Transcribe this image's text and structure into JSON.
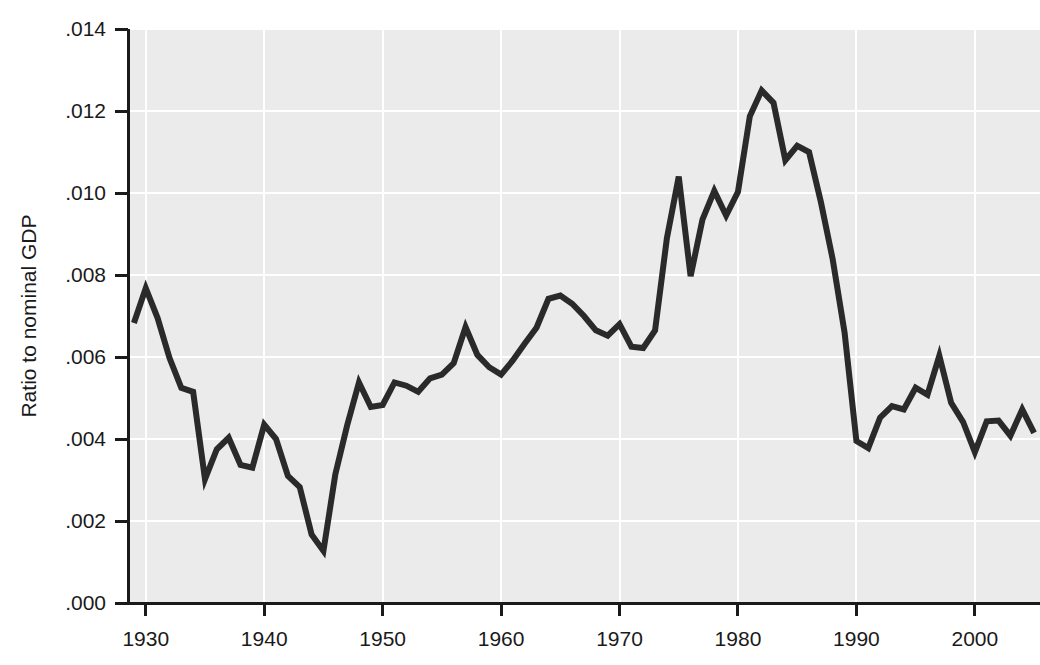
{
  "chart_data": {
    "type": "line",
    "title": "",
    "subtitle": "",
    "xlabel": "",
    "ylabel": "Ratio to nominal GDP",
    "xlim": [
      1928.5,
      2005.5
    ],
    "ylim": [
      0.0,
      0.014
    ],
    "xticks": [
      1930,
      1940,
      1950,
      1960,
      1970,
      1980,
      1990,
      2000
    ],
    "xticklabels": [
      "1930",
      "1940",
      "1950",
      "1960",
      "1970",
      "1980",
      "1990",
      "2000"
    ],
    "yticks": [
      0.0,
      0.002,
      0.004,
      0.006,
      0.008,
      0.01,
      0.012,
      0.014
    ],
    "yticklabels": [
      ".000",
      ".002",
      ".004",
      ".006",
      ".008",
      ".010",
      ".012",
      ".014"
    ],
    "grid": true,
    "grid_color": "#ffffff",
    "plot_background": "#ebebeb",
    "page_background": "#ffffff",
    "line_color": "#2a2a2a",
    "legend": null,
    "legend_position": "none",
    "series": [
      {
        "name": "Ratio to nominal GDP",
        "x": [
          1929,
          1930,
          1931,
          1932,
          1933,
          1934,
          1935,
          1936,
          1937,
          1938,
          1939,
          1940,
          1941,
          1942,
          1943,
          1944,
          1945,
          1946,
          1947,
          1948,
          1949,
          1950,
          1951,
          1952,
          1953,
          1954,
          1955,
          1956,
          1957,
          1958,
          1959,
          1960,
          1961,
          1962,
          1963,
          1964,
          1965,
          1966,
          1967,
          1968,
          1969,
          1970,
          1971,
          1972,
          1973,
          1974,
          1975,
          1976,
          1977,
          1978,
          1979,
          1980,
          1981,
          1982,
          1983,
          1984,
          1985,
          1986,
          1987,
          1988,
          1989,
          1990,
          1991,
          1992,
          1993,
          1994,
          1995,
          1996,
          1997,
          1998,
          1999,
          2000,
          2001,
          2002,
          2003,
          2004,
          2005
        ],
        "values": [
          0.00683,
          0.00768,
          0.00695,
          0.00598,
          0.00525,
          0.00515,
          0.00302,
          0.00375,
          0.00403,
          0.00337,
          0.0033,
          0.00435,
          0.004,
          0.0031,
          0.00283,
          0.00167,
          0.00127,
          0.00313,
          0.00433,
          0.00538,
          0.00478,
          0.00483,
          0.00538,
          0.0053,
          0.00515,
          0.00548,
          0.00557,
          0.00585,
          0.00673,
          0.00605,
          0.00575,
          0.00557,
          0.00592,
          0.00633,
          0.00672,
          0.00742,
          0.0075,
          0.0073,
          0.007,
          0.00665,
          0.00652,
          0.0068,
          0.00625,
          0.00622,
          0.00665,
          0.0089,
          0.0104,
          0.00797,
          0.00935,
          0.01005,
          0.00945,
          0.01003,
          0.01187,
          0.0125,
          0.0122,
          0.0108,
          0.01115,
          0.011,
          0.00978,
          0.00838,
          0.0066,
          0.00395,
          0.00378,
          0.00452,
          0.0048,
          0.00472,
          0.00525,
          0.00508,
          0.00603,
          0.00488,
          0.00442,
          0.00368,
          0.00443,
          0.00445,
          0.00408,
          0.00472,
          0.00415
        ],
        "style": "solid",
        "width": 6
      }
    ],
    "notes": [
      "Peak value 0.0125 occurs around 1982.",
      "Minimum value 0.0013 occurs around 1945.",
      "Secondary low of 0.0030 occurs around 1935."
    ]
  },
  "geometry": {
    "plot_left": 128,
    "plot_right": 1040,
    "plot_top": 29,
    "plot_bottom": 603
  }
}
